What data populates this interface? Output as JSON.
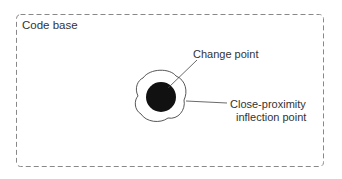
{
  "diagram": {
    "container_label": "Code base",
    "change_point_label": "Change point",
    "inflection_label_line1": "Close-proximity",
    "inflection_label_line2": "inflection point",
    "colors": {
      "border": "#888888",
      "core": "#111111",
      "outline": "#444444",
      "text": "#333333"
    }
  }
}
